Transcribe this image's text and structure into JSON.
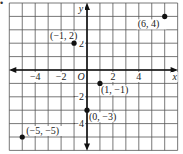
{
  "bullet": "•",
  "chart_data": {
    "type": "scatter",
    "title": "",
    "xlabel": "x",
    "ylabel": "y",
    "origin_label": "O",
    "xlim": [
      -6,
      7
    ],
    "ylim": [
      -6,
      5
    ],
    "grid": true,
    "x_ticks": [
      {
        "value": -4,
        "label": "−4"
      },
      {
        "value": -2,
        "label": "−2"
      },
      {
        "value": 2,
        "label": "2"
      },
      {
        "value": 4,
        "label": "4"
      }
    ],
    "y_ticks": [
      {
        "value": 2,
        "label": "2"
      },
      {
        "value": -2,
        "label": "−2"
      },
      {
        "value": -4,
        "label": "−4"
      }
    ],
    "points": [
      {
        "x": 6,
        "y": 4,
        "label": "(6, 4)"
      },
      {
        "x": -1,
        "y": 2,
        "label": "(−1, 2)"
      },
      {
        "x": 1,
        "y": -1,
        "label": "(1, −1)"
      },
      {
        "x": 0,
        "y": -3,
        "label": "(0, −3)"
      },
      {
        "x": -5,
        "y": -5,
        "label": "(−5, −5)"
      }
    ]
  }
}
